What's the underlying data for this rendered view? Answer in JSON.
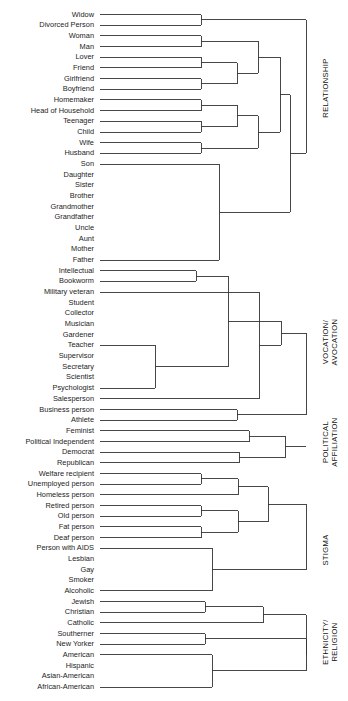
{
  "figure": {
    "type": "dendrogram",
    "orientation": "horizontal-right",
    "leaf_label_align": "right",
    "background": "#ffffff",
    "line_color": "#333333"
  },
  "chart_data": {
    "type": "dendrogram",
    "title": "",
    "xlabel": "",
    "ylabel": "",
    "grid": false,
    "legend": null,
    "leaf_count": 57,
    "leaves": [
      "Widow",
      "Divorced Person",
      "Woman",
      "Man",
      "Lover",
      "Friend",
      "Girlfriend",
      "Boyfriend",
      "Homemaker",
      "Head of Household",
      "Teenager",
      "Child",
      "Wife",
      "Husband",
      "Son",
      "Daughter",
      "Sister",
      "Brother",
      "Grandmother",
      "Grandfather",
      "Uncle",
      "Aunt",
      "Mother",
      "Father",
      "Intellectual",
      "Bookworm",
      "Military veteran",
      "Student",
      "Collector",
      "Musician",
      "Gardener",
      "Teacher",
      "Supervisor",
      "Secretary",
      "Scientist",
      "Psychologist",
      "Salesperson",
      "Business person",
      "Athlete",
      "Feminist",
      "Political Independent",
      "Democrat",
      "Republican",
      "Welfare recipient",
      "Unemployed person",
      "Homeless person",
      "Retired person",
      "Old person",
      "Fat person",
      "Deaf person",
      "Person with AIDS",
      "Lesbian",
      "Gay",
      "Smoker",
      "Alcoholic",
      "Jewish",
      "Christian",
      "Catholic",
      "Southerner",
      "New Yorker",
      "American",
      "Hispanic",
      "Asian-American",
      "African-American"
    ],
    "clusters": [
      {
        "name": "RELATIONSHIP",
        "members": [
          "Widow",
          "Divorced Person",
          "Woman",
          "Man",
          "Lover",
          "Friend",
          "Girlfriend",
          "Boyfriend",
          "Homemaker",
          "Head of Household",
          "Teenager",
          "Child",
          "Wife",
          "Husband",
          "Son",
          "Daughter",
          "Sister",
          "Brother",
          "Grandmother",
          "Grandfather",
          "Uncle",
          "Aunt",
          "Mother",
          "Father"
        ]
      },
      {
        "name": "VOCATION/ AVOCATION",
        "members": [
          "Intellectual",
          "Bookworm",
          "Military veteran",
          "Student",
          "Collector",
          "Musician",
          "Gardener",
          "Teacher",
          "Supervisor",
          "Secretary",
          "Scientist",
          "Psychologist",
          "Salesperson",
          "Business person",
          "Athlete"
        ]
      },
      {
        "name": "POLITICAL AFFILIATION",
        "members": [
          "Feminist",
          "Political Independent",
          "Democrat",
          "Republican"
        ]
      },
      {
        "name": "STIGMA",
        "members": [
          "Welfare recipient",
          "Unemployed person",
          "Homeless person",
          "Retired person",
          "Old person",
          "Fat person",
          "Deaf person",
          "Person with AIDS",
          "Lesbian",
          "Gay",
          "Smoker",
          "Alcoholic"
        ]
      },
      {
        "name": "ETHNICITY/ RELIGION",
        "members": [
          "Jewish",
          "Christian",
          "Catholic",
          "Southerner",
          "New Yorker",
          "American",
          "Hispanic",
          "Asian-American",
          "African-American"
        ]
      }
    ]
  },
  "categories": [
    {
      "label_line1": "RELATIONSHIP",
      "label_line2": ""
    },
    {
      "label_line1": "VOCATION/",
      "label_line2": "AVOCATION"
    },
    {
      "label_line1": "POLITICAL",
      "label_line2": "AFFILIATION"
    },
    {
      "label_line1": "STIGMA",
      "label_line2": ""
    },
    {
      "label_line1": "ETHNICITY/",
      "label_line2": "RELIGION"
    }
  ]
}
